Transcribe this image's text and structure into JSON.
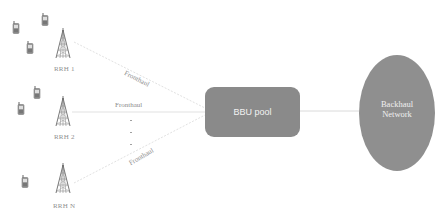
{
  "diagram": {
    "type": "C-RAN architecture",
    "rrh_units": [
      {
        "label": "RRH 1",
        "tower_x": 63,
        "tower_top": 28,
        "label_x": 54,
        "label_y": 66
      },
      {
        "label": "RRH 2",
        "tower_x": 63,
        "tower_top": 96,
        "label_x": 54,
        "label_y": 134
      },
      {
        "label": "RRH N",
        "tower_x": 63,
        "tower_top": 163,
        "label_x": 53,
        "label_y": 203
      }
    ],
    "fronthaul_labels": [
      "Fronthaul",
      "Fronthaul",
      "Fronthaul"
    ],
    "ellipsis_dots": [
      ".",
      ".",
      "."
    ],
    "bbu_pool": {
      "label": "BBU pool",
      "fill": "#8a8a8a"
    },
    "backhaul": {
      "line1": "Backhaul",
      "line2": "Network",
      "fill": "#8f8f8f"
    },
    "colors": {
      "node_fill": "#8a8a8a",
      "link_line": "#dcdcdc",
      "label_text": "#8a8a8a"
    }
  }
}
